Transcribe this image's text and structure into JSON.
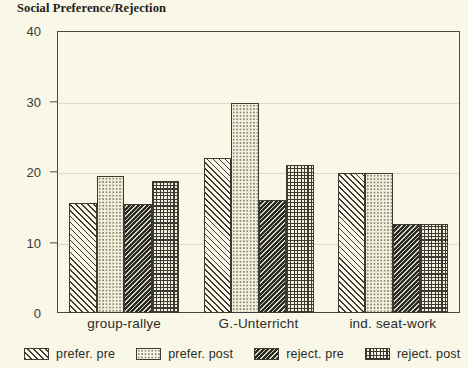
{
  "chart_data": {
    "type": "bar",
    "title": "Social Preference/Rejection",
    "xlabel": "",
    "ylabel": "",
    "ylim": [
      0,
      40
    ],
    "yticks": [
      0,
      10,
      20,
      30,
      40
    ],
    "grid": true,
    "legend_position": "bottom",
    "categories": [
      "group-rallye",
      "G.-Unterricht",
      "ind. seat-work"
    ],
    "series": [
      {
        "name": "prefer. pre",
        "pattern": "diagonal-hatch-light",
        "values": [
          15.6,
          22.0,
          19.8
        ]
      },
      {
        "name": "prefer. post",
        "pattern": "fine-dots",
        "values": [
          19.5,
          29.8,
          19.8
        ]
      },
      {
        "name": "reject. pre",
        "pattern": "dense-diagonal-dark",
        "values": [
          15.5,
          16.1,
          12.6
        ]
      },
      {
        "name": "reject. post",
        "pattern": "cross-grid",
        "values": [
          18.7,
          21.0,
          12.6
        ]
      }
    ]
  },
  "colors": {
    "background": "#f8f7e8",
    "ink": "#3b3b33",
    "grid": "#ded9c4",
    "axis": "#4a4a42"
  }
}
